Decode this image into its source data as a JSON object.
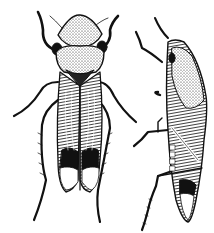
{
  "image": {
    "kind": "engraving illustration",
    "subject": "leafhopper insect",
    "views": [
      {
        "name": "dorsal view",
        "position": "left"
      },
      {
        "name": "lateral view",
        "position": "right"
      }
    ],
    "colors": {
      "ink": "#111111",
      "paper": "#ffffff",
      "midtone": "#555555"
    }
  }
}
